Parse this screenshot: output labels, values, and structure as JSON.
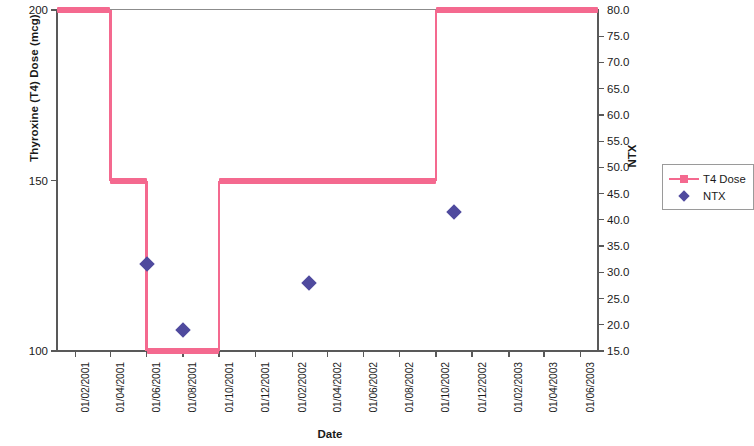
{
  "chart_data": {
    "type": "line",
    "title": "",
    "xlabel": "Date",
    "ylabel": "Thyroxine (T4) Dose (mcg)",
    "y2label": "NTX",
    "grid": false,
    "legend_position": "right",
    "xlim": [
      "01/01/2001",
      "01/07/2003"
    ],
    "ylim": [
      100,
      200
    ],
    "y2lim": [
      15.0,
      80.0
    ],
    "x_tick_labels": [
      "01/02/2001",
      "01/04/2001",
      "01/06/2001",
      "01/08/2001",
      "01/10/2001",
      "01/12/2001",
      "01/02/2002",
      "01/04/2002",
      "01/06/2002",
      "01/08/2002",
      "01/10/2002",
      "01/12/2002",
      "01/02/2003",
      "01/04/2003",
      "01/06/2003"
    ],
    "y_tick_labels": [
      "100",
      "150",
      "200"
    ],
    "y_tick_values": [
      100,
      150,
      200
    ],
    "y2_tick_labels": [
      "15.0",
      "20.0",
      "25.0",
      "30.0",
      "35.0",
      "40.0",
      "45.0",
      "50.0",
      "55.0",
      "60.0",
      "65.0",
      "70.0",
      "75.0",
      "80.0"
    ],
    "y2_tick_values": [
      15,
      20,
      25,
      30,
      35,
      40,
      45,
      50,
      55,
      60,
      65,
      70,
      75,
      80
    ],
    "series": [
      {
        "name": "T4 Dose",
        "type": "step",
        "axis": "left",
        "color": "#f4698f",
        "marker": "square",
        "steps": [
          {
            "x_start": "01/01/2001",
            "x_end": "01/04/2001",
            "value": 200
          },
          {
            "x_start": "01/04/2001",
            "x_end": "01/06/2001",
            "value": 150
          },
          {
            "x_start": "01/06/2001",
            "x_end": "01/10/2001",
            "value": 100
          },
          {
            "x_start": "01/10/2001",
            "x_end": "01/10/2002",
            "value": 150
          },
          {
            "x_start": "01/10/2002",
            "x_end": "01/07/2003",
            "value": 200
          }
        ]
      },
      {
        "name": "NTX",
        "type": "scatter",
        "axis": "right",
        "color": "#4f4a9e",
        "marker": "diamond",
        "points": [
          {
            "x": "01/06/2001",
            "y": 31.5
          },
          {
            "x": "01/08/2001",
            "y": 19.0
          },
          {
            "x": "01/03/2002",
            "y": 28.0
          },
          {
            "x": "01/11/2002",
            "y": 41.5
          }
        ]
      }
    ],
    "legend": [
      {
        "label": "T4 Dose",
        "color": "#f4698f",
        "marker": "line-square"
      },
      {
        "label": "NTX",
        "color": "#4f4a9e",
        "marker": "diamond"
      }
    ]
  }
}
